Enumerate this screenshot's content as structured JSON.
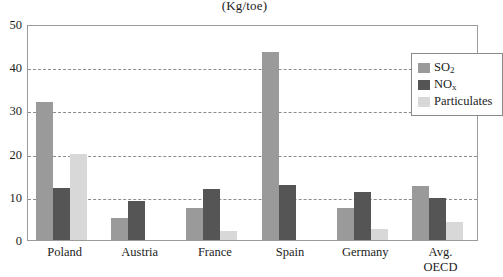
{
  "chart_data": {
    "type": "bar",
    "title": "(Kg/toe)",
    "xlabel": "",
    "ylabel": "",
    "ylim": [
      0,
      50
    ],
    "yticks": [
      0,
      10,
      20,
      30,
      40,
      50
    ],
    "ytick_labels": [
      "0",
      "10",
      "20",
      "30",
      "40",
      "50"
    ],
    "grid": true,
    "grid_style": "dashed-horizontal",
    "legend_position": "top-right-inside",
    "categories": [
      "Poland",
      "Austria",
      "France",
      "Spain",
      "Germany",
      "Avg.\nOECD"
    ],
    "series": [
      {
        "name": "SO2",
        "label_html": "SO₂",
        "color": "#9a9a9a",
        "values": [
          32,
          5,
          7.3,
          43.5,
          7.5,
          12.5
        ]
      },
      {
        "name": "NOx",
        "label_html": "NOₓ",
        "color": "#555555",
        "values": [
          12,
          9,
          11.7,
          12.8,
          11.2,
          9.7
        ]
      },
      {
        "name": "Particulates",
        "label_html": "Particulates",
        "color": "#d8d8d8",
        "values": [
          19.8,
          0,
          2,
          0,
          2.5,
          4.2
        ]
      }
    ]
  },
  "legend": {
    "items": [
      {
        "label": "SO",
        "sub": "2"
      },
      {
        "label": "NO",
        "sub": "x"
      },
      {
        "label": "Particulates",
        "sub": ""
      }
    ]
  },
  "axis": {
    "y_tick_labels": [
      "50",
      "40",
      "30",
      "20",
      "10",
      "0"
    ]
  },
  "colors": {
    "so2": "#9a9a9a",
    "nox": "#555555",
    "particulates": "#d8d8d8",
    "frame": "#9b9b9b",
    "gridline": "#8c8c8c",
    "text": "#1c1c1c",
    "background": "#ffffff"
  }
}
